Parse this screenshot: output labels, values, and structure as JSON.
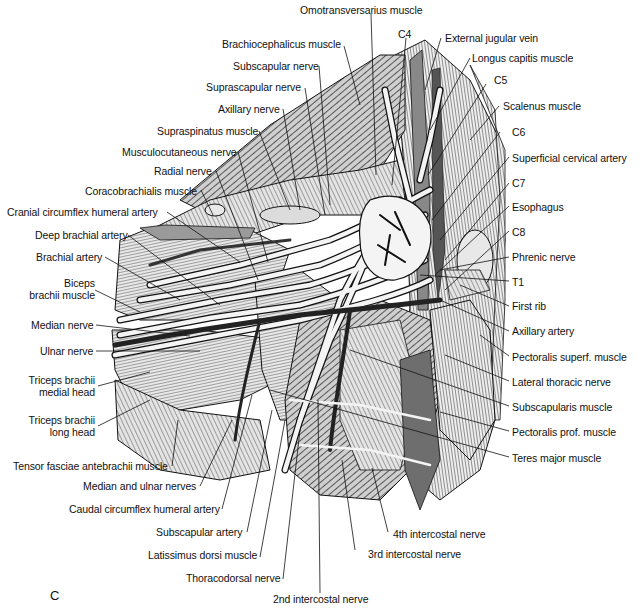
{
  "figure": {
    "panel_letter": "C",
    "type": "anatomical illustration",
    "view": "axillary / brachial plexus region (canine, left lateral dissection)"
  },
  "labels": {
    "top": [
      {
        "id": "omotransversarius",
        "text": "Omotransversarius muscle"
      },
      {
        "id": "c4",
        "text": "C4"
      },
      {
        "id": "external_jugular",
        "text": "External jugular vein"
      },
      {
        "id": "brachiocephalicus",
        "text": "Brachiocephalicus muscle"
      },
      {
        "id": "longus_capitis",
        "text": "Longus capitis muscle"
      },
      {
        "id": "subscapular_nerve",
        "text": "Subscapular nerve"
      },
      {
        "id": "suprascapular_nerve",
        "text": "Suprascapular nerve"
      },
      {
        "id": "c5",
        "text": "C5"
      },
      {
        "id": "axillary_nerve",
        "text": "Axillary nerve"
      },
      {
        "id": "scalenus",
        "text": "Scalenus muscle"
      }
    ],
    "left": [
      {
        "id": "supraspinatus",
        "text": "Supraspinatus muscle"
      },
      {
        "id": "musculocutaneous",
        "text": "Musculocutaneous nerve"
      },
      {
        "id": "radial_nerve",
        "text": "Radial nerve"
      },
      {
        "id": "coracobrachialis",
        "text": "Coracobrachialis muscle"
      },
      {
        "id": "cranial_circumflex",
        "text": "Cranial circumflex humeral artery"
      },
      {
        "id": "deep_brachial",
        "text": "Deep brachial artery"
      },
      {
        "id": "brachial_artery",
        "text": "Brachial artery"
      },
      {
        "id": "biceps_1",
        "text": "Biceps"
      },
      {
        "id": "biceps_2",
        "text": "brachii muscle"
      },
      {
        "id": "median_nerve",
        "text": "Median nerve"
      },
      {
        "id": "ulnar_nerve",
        "text": "Ulnar nerve"
      },
      {
        "id": "triceps_medial_1",
        "text": "Triceps brachii"
      },
      {
        "id": "triceps_medial_2",
        "text": "medial head"
      },
      {
        "id": "triceps_long_1",
        "text": "Triceps brachii"
      },
      {
        "id": "triceps_long_2",
        "text": "long head"
      }
    ],
    "right": [
      {
        "id": "c6",
        "text": "C6"
      },
      {
        "id": "superficial_cervical",
        "text": "Superficial cervical artery"
      },
      {
        "id": "c7",
        "text": "C7"
      },
      {
        "id": "esophagus",
        "text": "Esophagus"
      },
      {
        "id": "c8",
        "text": "C8"
      },
      {
        "id": "phrenic",
        "text": "Phrenic nerve"
      },
      {
        "id": "t1",
        "text": "T1"
      },
      {
        "id": "first_rib",
        "text": "First rib"
      },
      {
        "id": "axillary_artery",
        "text": "Axillary artery"
      },
      {
        "id": "pectoralis_superf",
        "text": "Pectoralis superf. muscle"
      },
      {
        "id": "lateral_thoracic",
        "text": "Lateral thoracic nerve"
      },
      {
        "id": "subscapularis",
        "text": "Subscapularis muscle"
      },
      {
        "id": "pectoralis_prof",
        "text": "Pectoralis prof. muscle"
      },
      {
        "id": "teres_major",
        "text": "Teres major muscle"
      }
    ],
    "bottom": [
      {
        "id": "tensor_fasciae",
        "text": "Tensor fasciae antebrachii muscle"
      },
      {
        "id": "median_ulnar",
        "text": "Median and ulnar nerves"
      },
      {
        "id": "caudal_circumflex",
        "text": "Caudal circumflex humeral artery"
      },
      {
        "id": "subscapular_artery",
        "text": "Subscapular artery"
      },
      {
        "id": "latissimus",
        "text": "Latissimus dorsi muscle"
      },
      {
        "id": "thoracodorsal",
        "text": "Thoracodorsal nerve"
      },
      {
        "id": "intercostal_4",
        "text": "4th intercostal nerve"
      },
      {
        "id": "intercostal_3",
        "text": "3rd intercostal nerve"
      },
      {
        "id": "intercostal_2",
        "text": "2nd intercostal nerve"
      }
    ]
  },
  "colors": {
    "ink": "#111111",
    "muscle_fill": "#d9d9d9",
    "muscle_dark": "#6e6e6e",
    "nerve_fill": "#f2f2f2",
    "vessel_fill": "#3a3a3a",
    "background": "#ffffff"
  }
}
